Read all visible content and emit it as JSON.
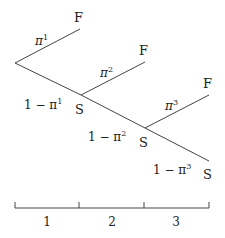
{
  "diagram": {
    "type": "decision-tree",
    "stages": [
      {
        "prob_fail": "π",
        "prob_fail_sup": "1",
        "prob_succ": "1 − π",
        "prob_succ_sup": "1",
        "fail_label": "F",
        "succ_label": "S"
      },
      {
        "prob_fail": "π",
        "prob_fail_sup": "2",
        "prob_succ": "1 − π",
        "prob_succ_sup": "2",
        "fail_label": "F",
        "succ_label": "S"
      },
      {
        "prob_fail": "π",
        "prob_fail_sup": "3",
        "prob_succ": "1 − π",
        "prob_succ_sup": "3",
        "fail_label": "F",
        "succ_label": "S"
      }
    ],
    "timeline": {
      "labels": [
        "1",
        "2",
        "3"
      ]
    },
    "colors": {
      "line": "#444444",
      "text": "#222222",
      "background": "#ffffff"
    }
  }
}
